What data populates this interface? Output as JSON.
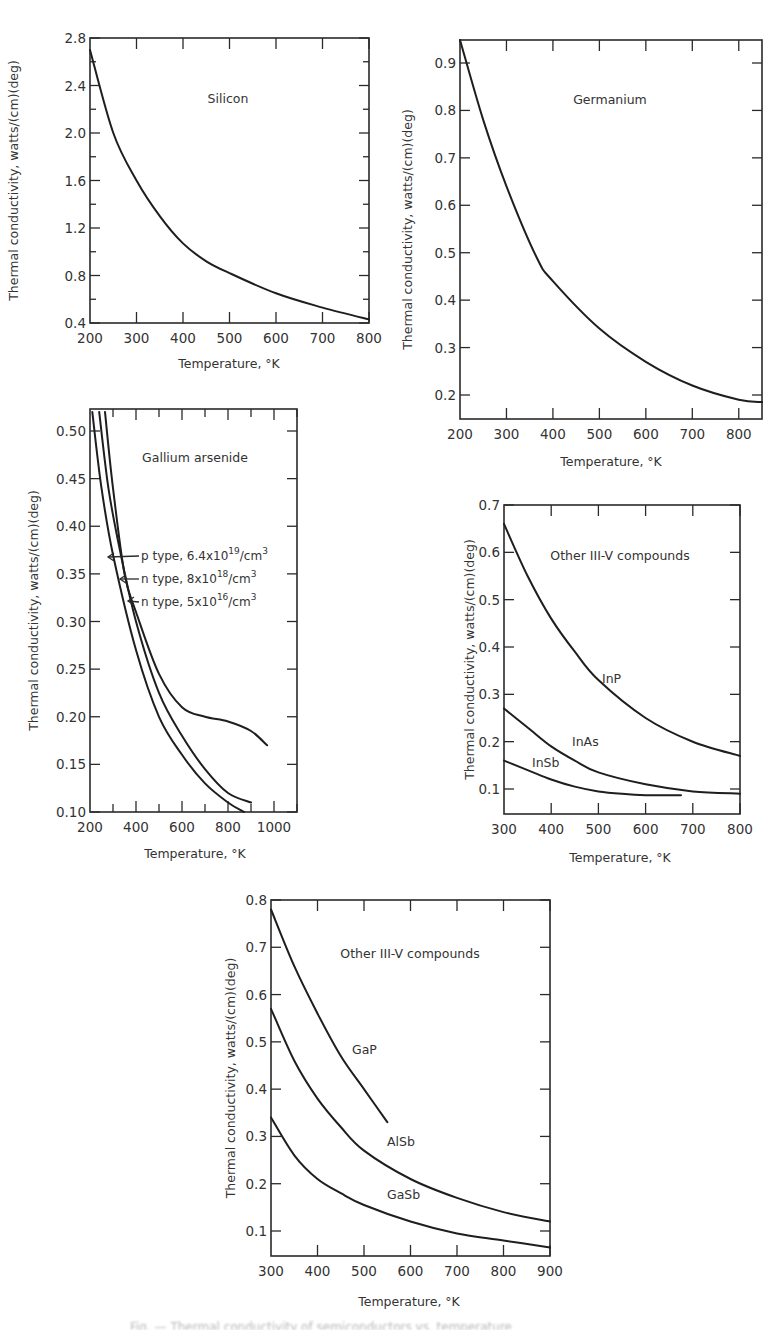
{
  "figure": {
    "caption_fragment": "Fig. — Thermal conductivity of semiconductors vs. temperature"
  },
  "chart_data": [
    {
      "id": "silicon",
      "type": "line",
      "title": "Silicon",
      "xlabel": "Temperature, °K",
      "ylabel": "Thermal conductivity, watts/(cm)(deg)",
      "xlim": [
        200,
        800
      ],
      "ylim": [
        0.4,
        2.8
      ],
      "xticks": [
        "200",
        "300",
        "400",
        "500",
        "600",
        "700",
        "800"
      ],
      "yticks": [
        "0.4",
        "0.8",
        "1.2",
        "1.6",
        "2.0",
        "2.4",
        "2.8"
      ],
      "series": [
        {
          "name": "Silicon",
          "x": [
            200,
            250,
            300,
            350,
            400,
            450,
            500,
            600,
            700,
            800
          ],
          "values": [
            2.7,
            2.0,
            1.6,
            1.3,
            1.07,
            0.92,
            0.82,
            0.65,
            0.53,
            0.43
          ]
        }
      ]
    },
    {
      "id": "germanium",
      "type": "line",
      "title": "Germanium",
      "xlabel": "Temperature, °K",
      "ylabel": "Thermal conductivity, watts/(cm)(deg)",
      "xlim": [
        200,
        850
      ],
      "ylim": [
        0.15,
        0.95
      ],
      "xticks": [
        "200",
        "300",
        "400",
        "500",
        "600",
        "700",
        "800"
      ],
      "yticks": [
        "0.2",
        "0.3",
        "0.4",
        "0.5",
        "0.6",
        "0.7",
        "0.8",
        "0.9"
      ],
      "series": [
        {
          "name": "Germanium",
          "x": [
            200,
            250,
            300,
            365,
            400,
            500,
            600,
            700,
            800,
            850
          ],
          "values": [
            0.95,
            0.78,
            0.64,
            0.49,
            0.44,
            0.34,
            0.27,
            0.22,
            0.19,
            0.185
          ]
        }
      ]
    },
    {
      "id": "gallium-arsenide",
      "type": "line",
      "title": "Gallium arsenide",
      "xlabel": "Temperature, °K",
      "ylabel": "Thermal conductivity, watts/(cm)(deg)",
      "xlim": [
        200,
        1100
      ],
      "ylim": [
        0.1,
        0.52
      ],
      "xticks": [
        "200",
        "400",
        "600",
        "800",
        "1000"
      ],
      "yticks": [
        "0.10",
        "0.15",
        "0.20",
        "0.25",
        "0.30",
        "0.35",
        "0.40",
        "0.45",
        "0.50"
      ],
      "series": [
        {
          "name": "p type, 6.4x10^19/cm^3",
          "x": [
            210,
            250,
            300,
            400,
            500,
            600,
            700,
            800,
            870
          ],
          "values": [
            0.52,
            0.44,
            0.37,
            0.27,
            0.2,
            0.16,
            0.13,
            0.11,
            0.1
          ]
        },
        {
          "name": "n type, 8x10^18/cm^3",
          "x": [
            240,
            280,
            330,
            400,
            500,
            600,
            700,
            800,
            900
          ],
          "values": [
            0.52,
            0.44,
            0.375,
            0.3,
            0.225,
            0.18,
            0.145,
            0.12,
            0.11
          ]
        },
        {
          "name": "n type, 5x10^16/cm^3",
          "x": [
            265,
            300,
            350,
            400,
            500,
            600,
            700,
            800,
            900,
            970
          ],
          "values": [
            0.52,
            0.44,
            0.35,
            0.31,
            0.245,
            0.21,
            0.2,
            0.195,
            0.185,
            0.17
          ]
        }
      ],
      "annotations": [
        {
          "label": "p type, 6.4x10",
          "sup": "19",
          "tail": "/cm",
          "tail_sup": "3"
        },
        {
          "label": "n type, 8x10",
          "sup": "18",
          "tail": "/cm",
          "tail_sup": "3"
        },
        {
          "label": "n type, 5x10",
          "sup": "16",
          "tail": "/cm",
          "tail_sup": "3"
        }
      ]
    },
    {
      "id": "other-iii-v-a",
      "type": "line",
      "title": "Other III-V compounds",
      "xlabel": "Temperature, °K",
      "ylabel": "Thermal conductivity, watts/(cm)(deg)",
      "xlim": [
        300,
        800
      ],
      "ylim": [
        0.05,
        0.7
      ],
      "xticks": [
        "300",
        "400",
        "500",
        "600",
        "700",
        "800"
      ],
      "yticks": [
        "0.1",
        "0.2",
        "0.3",
        "0.4",
        "0.5",
        "0.6",
        "0.7"
      ],
      "series": [
        {
          "name": "InP",
          "x": [
            300,
            350,
            400,
            450,
            500,
            600,
            700,
            800
          ],
          "values": [
            0.66,
            0.55,
            0.46,
            0.39,
            0.33,
            0.25,
            0.2,
            0.17
          ]
        },
        {
          "name": "InAs",
          "x": [
            300,
            350,
            400,
            450,
            500,
            600,
            700,
            800
          ],
          "values": [
            0.27,
            0.23,
            0.19,
            0.16,
            0.135,
            0.11,
            0.095,
            0.09
          ]
        },
        {
          "name": "InSb",
          "x": [
            300,
            350,
            400,
            450,
            500,
            550,
            600,
            675
          ],
          "values": [
            0.16,
            0.14,
            0.12,
            0.105,
            0.095,
            0.09,
            0.087,
            0.087
          ]
        }
      ]
    },
    {
      "id": "other-iii-v-b",
      "type": "line",
      "title": "Other III-V compounds",
      "xlabel": "Temperature, °K",
      "ylabel": "Thermal conductivity, watts/(cm)(deg)",
      "xlim": [
        300,
        900
      ],
      "ylim": [
        0.05,
        0.8
      ],
      "xticks": [
        "300",
        "400",
        "500",
        "600",
        "700",
        "800",
        "900"
      ],
      "yticks": [
        "0.1",
        "0.2",
        "0.3",
        "0.4",
        "0.5",
        "0.6",
        "0.7",
        "0.8"
      ],
      "series": [
        {
          "name": "GaP",
          "x": [
            300,
            350,
            400,
            450,
            500,
            550
          ],
          "values": [
            0.78,
            0.66,
            0.56,
            0.47,
            0.4,
            0.33
          ]
        },
        {
          "name": "AlSb",
          "x": [
            300,
            350,
            400,
            450,
            500,
            600,
            700,
            800,
            900
          ],
          "values": [
            0.57,
            0.46,
            0.38,
            0.32,
            0.27,
            0.21,
            0.17,
            0.14,
            0.12
          ]
        },
        {
          "name": "GaSb",
          "x": [
            300,
            350,
            400,
            450,
            500,
            600,
            700,
            800,
            900
          ],
          "values": [
            0.34,
            0.26,
            0.21,
            0.18,
            0.155,
            0.12,
            0.095,
            0.08,
            0.065
          ]
        }
      ]
    }
  ]
}
